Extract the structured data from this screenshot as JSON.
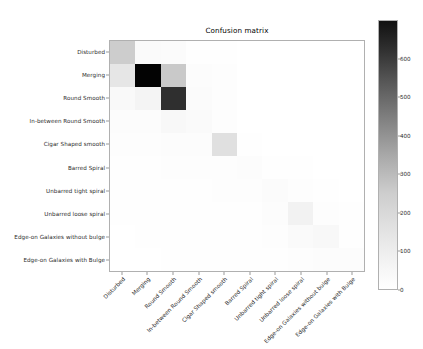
{
  "figure": {
    "title": "Confusion matrix"
  },
  "chart_data": {
    "type": "heatmap",
    "title": "Confusion matrix",
    "xlabel": "",
    "ylabel": "",
    "grid": false,
    "legend_position": "right-colorbar",
    "colormap": "Greys",
    "categories": [
      "Disturbed",
      "Merging",
      "Round Smooth",
      "In-between Round Smooth",
      "Cigar Shaped smooth",
      "Barred Spiral",
      "Unbarred tight spiral",
      "Unbarred loose spiral",
      "Edge-on Galaxies without bulge",
      "Edge-on Galaxies with Bulge"
    ],
    "x_tick_labels": [
      "Disturbed",
      "Merging",
      "Round Smooth",
      "In-between Round Smooth",
      "Cigar Shaped smooth",
      "Barred Spiral",
      "Unbarred tight spiral",
      "Unbarred loose spiral",
      "Edge-on Galaxies without bulge",
      "Edge-on Galaxies with Bulge"
    ],
    "y_tick_labels": [
      "Disturbed",
      "Merging",
      "Round Smooth",
      "In-between Round Smooth",
      "Cigar Shaped smooth",
      "Barred Spiral",
      "Unbarred tight spiral",
      "Unbarred loose spiral",
      "Edge-on Galaxies without bulge",
      "Edge-on Galaxies with Bulge"
    ],
    "colorbar": {
      "min": 0,
      "max": 700,
      "ticks": [
        0,
        100,
        200,
        300,
        400,
        500,
        600
      ],
      "tick_labels": [
        "0",
        "100",
        "200",
        "300",
        "400",
        "500",
        "600"
      ]
    },
    "vmin": 0,
    "vmax": 700,
    "matrix": [
      [
        120,
        10,
        8,
        2,
        1,
        0,
        0,
        0,
        0,
        0
      ],
      [
        55,
        690,
        130,
        6,
        3,
        0,
        0,
        0,
        0,
        0
      ],
      [
        12,
        22,
        560,
        8,
        4,
        0,
        0,
        0,
        0,
        0
      ],
      [
        6,
        5,
        14,
        9,
        3,
        0,
        0,
        0,
        0,
        0
      ],
      [
        4,
        3,
        6,
        5,
        70,
        2,
        0,
        0,
        0,
        0
      ],
      [
        2,
        2,
        3,
        3,
        4,
        6,
        2,
        1,
        0,
        0
      ],
      [
        1,
        1,
        2,
        2,
        3,
        3,
        8,
        4,
        1,
        0
      ],
      [
        1,
        1,
        1,
        2,
        2,
        2,
        6,
        28,
        3,
        1
      ],
      [
        0,
        1,
        1,
        1,
        1,
        2,
        3,
        9,
        14,
        2
      ],
      [
        0,
        0,
        1,
        1,
        1,
        1,
        2,
        3,
        6,
        5
      ]
    ]
  }
}
